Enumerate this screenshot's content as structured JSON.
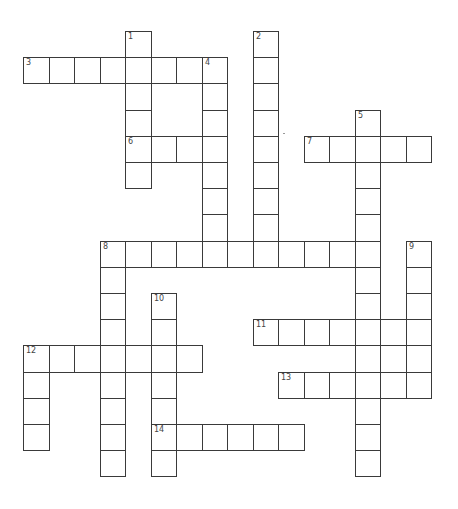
{
  "puzzle": {
    "type": "crossword",
    "grid": {
      "origin_x": 23,
      "origin_y": 31,
      "cell_w": 25.5,
      "cell_h": 26.2,
      "line_color": "#3a3a3a"
    },
    "entries": [
      {
        "number": "1",
        "direction": "down",
        "row": 0,
        "col": 4,
        "length": 6
      },
      {
        "number": "2",
        "direction": "down",
        "row": 0,
        "col": 9,
        "length": 9
      },
      {
        "number": "3",
        "direction": "across",
        "row": 1,
        "col": 0,
        "length": 8
      },
      {
        "number": "4",
        "direction": "down",
        "row": 1,
        "col": 7,
        "length": 8
      },
      {
        "number": "5",
        "direction": "down",
        "row": 3,
        "col": 13,
        "length": 14
      },
      {
        "number": "6",
        "direction": "across",
        "row": 4,
        "col": 4,
        "length": 4
      },
      {
        "number": "7",
        "direction": "across",
        "row": 4,
        "col": 11,
        "length": 5
      },
      {
        "number": "8",
        "direction": "across",
        "row": 8,
        "col": 3,
        "length": 11
      },
      {
        "number": "8",
        "direction": "down",
        "row": 8,
        "col": 3,
        "length": 9
      },
      {
        "number": "9",
        "direction": "down",
        "row": 8,
        "col": 15,
        "length": 6
      },
      {
        "number": "10",
        "direction": "down",
        "row": 10,
        "col": 5,
        "length": 7
      },
      {
        "number": "11",
        "direction": "across",
        "row": 11,
        "col": 9,
        "length": 7
      },
      {
        "number": "12",
        "direction": "across",
        "row": 12,
        "col": 0,
        "length": 7
      },
      {
        "number": "12",
        "direction": "down",
        "row": 12,
        "col": 0,
        "length": 4
      },
      {
        "number": "13",
        "direction": "across",
        "row": 13,
        "col": 10,
        "length": 6
      },
      {
        "number": "14",
        "direction": "across",
        "row": 15,
        "col": 5,
        "length": 6
      }
    ]
  }
}
